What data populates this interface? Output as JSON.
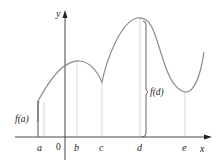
{
  "figure": {
    "axes": {
      "x_label": "x",
      "y_label": "y",
      "origin_label": "0"
    },
    "points": [
      {
        "label": "a",
        "x_px": 40
      },
      {
        "label": "b",
        "x_px": 77
      },
      {
        "label": "c",
        "x_px": 102
      },
      {
        "label": "d",
        "x_px": 140
      },
      {
        "label": "e",
        "x_px": 185
      }
    ],
    "annotations": {
      "f_a": "f(a)",
      "f_d": "f(d)"
    },
    "colors": {
      "curve": "#8a8a8a",
      "axis": "#333333",
      "guide": "#cfcfcf",
      "brace": "#555555"
    }
  }
}
